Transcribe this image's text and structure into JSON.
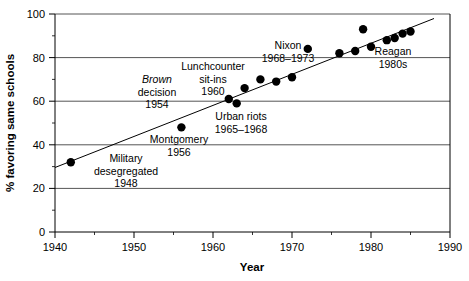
{
  "chart_data": {
    "type": "scatter",
    "title": "",
    "xlabel": "Year",
    "ylabel": "% favoring same schools",
    "xlim": [
      1940,
      1990
    ],
    "ylim": [
      0,
      100
    ],
    "xticks": [
      1940,
      1950,
      1960,
      1970,
      1980,
      1990
    ],
    "xtick_labels": [
      "1940",
      "1950",
      "1960",
      "1970",
      "1980",
      "1990"
    ],
    "yticks": [
      0,
      20,
      40,
      60,
      80,
      100
    ],
    "ytick_labels": [
      "0",
      "20",
      "40",
      "60",
      "80",
      "100"
    ],
    "grid": "horizontal",
    "legend": "none",
    "series": [
      {
        "name": "% favoring same schools",
        "marker": "filled-circle",
        "x": [
          1942,
          1956,
          1962,
          1963,
          1964,
          1966,
          1968,
          1970,
          1972,
          1976,
          1978,
          1979,
          1980,
          1982,
          1983,
          1984,
          1985
        ],
        "y": [
          32,
          48,
          61,
          59,
          66,
          70,
          69,
          71,
          84,
          82,
          83,
          93,
          85,
          88,
          89,
          91,
          92
        ]
      }
    ],
    "trend_line": {
      "x": [
        1940,
        1988
      ],
      "y": [
        30,
        99
      ]
    },
    "annotations": [
      {
        "name": "military-desegregated",
        "lines": [
          "Military",
          "desegregated",
          "1948"
        ],
        "italic_line_index": -1
      },
      {
        "name": "brown-decision",
        "lines": [
          "Brown",
          "decision",
          "1954"
        ],
        "italic_line_index": 0
      },
      {
        "name": "montgomery",
        "lines": [
          "Montgomery",
          "1956"
        ],
        "italic_line_index": -1
      },
      {
        "name": "lunchcounter-sit-ins",
        "lines": [
          "Lunchcounter",
          "sit-ins",
          "1960"
        ],
        "italic_line_index": -1
      },
      {
        "name": "urban-riots",
        "lines": [
          "Urban riots",
          "1965–1968"
        ],
        "italic_line_index": -1
      },
      {
        "name": "nixon",
        "lines": [
          "Nixon",
          "1968–1973"
        ],
        "italic_line_index": -1
      },
      {
        "name": "reagan",
        "lines": [
          "Reagan",
          "1980s"
        ],
        "italic_line_index": -1
      }
    ]
  },
  "annotations_text": {
    "military": {
      "l1": "Military",
      "l2": "desegregated",
      "l3": "1948"
    },
    "brown": {
      "l1": "Brown",
      "l2": "decision",
      "l3": "1954"
    },
    "montgomery": {
      "l1": "Montgomery",
      "l2": "1956"
    },
    "lunchcounter": {
      "l1": "Lunchcounter",
      "l2": "sit-ins",
      "l3": "1960"
    },
    "urban_riots": {
      "l1": "Urban riots",
      "l2": "1965–1968"
    },
    "nixon": {
      "l1": "Nixon",
      "l2": "1968–1973"
    },
    "reagan": {
      "l1": "Reagan",
      "l2": "1980s"
    }
  },
  "axes": {
    "x_title": "Year",
    "y_title": "% favoring same schools"
  }
}
